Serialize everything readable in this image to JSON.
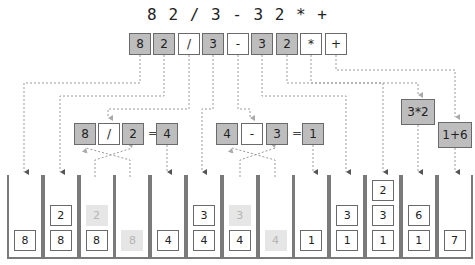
{
  "title": "8 2 / 3 - 3 2 * +",
  "tokens": [
    {
      "label": "8",
      "kind": "num",
      "x": 129
    },
    {
      "label": "2",
      "kind": "num",
      "x": 153
    },
    {
      "label": "/",
      "kind": "op",
      "x": 178
    },
    {
      "label": "3",
      "kind": "num",
      "x": 202
    },
    {
      "label": "-",
      "kind": "op",
      "x": 227
    },
    {
      "label": "3",
      "kind": "num",
      "x": 251
    },
    {
      "label": "2",
      "kind": "num",
      "x": 276
    },
    {
      "label": "*",
      "kind": "op",
      "x": 300
    },
    {
      "label": "+",
      "kind": "op",
      "x": 325
    }
  ],
  "operations": {
    "div": {
      "left": "8",
      "op": "/",
      "right": "2",
      "eq": "=",
      "result": "4"
    },
    "sub": {
      "left": "4",
      "op": "-",
      "right": "3",
      "eq": "=",
      "result": "1"
    },
    "mul": {
      "expr": "3*2"
    },
    "add": {
      "expr": "1+6"
    }
  },
  "stacks": [
    {
      "cells": [
        {
          "v": "8",
          "ghost": false
        }
      ]
    },
    {
      "cells": [
        {
          "v": "8",
          "ghost": false
        },
        {
          "v": "2",
          "ghost": false
        }
      ]
    },
    {
      "cells": [
        {
          "v": "8",
          "ghost": false
        },
        {
          "v": "2",
          "ghost": true
        }
      ]
    },
    {
      "cells": [
        {
          "v": "8",
          "ghost": true
        }
      ]
    },
    {
      "cells": [
        {
          "v": "4",
          "ghost": false
        }
      ]
    },
    {
      "cells": [
        {
          "v": "4",
          "ghost": false
        },
        {
          "v": "3",
          "ghost": false
        }
      ]
    },
    {
      "cells": [
        {
          "v": "4",
          "ghost": false
        },
        {
          "v": "3",
          "ghost": true
        }
      ]
    },
    {
      "cells": [
        {
          "v": "4",
          "ghost": true
        }
      ]
    },
    {
      "cells": [
        {
          "v": "1",
          "ghost": false
        }
      ]
    },
    {
      "cells": [
        {
          "v": "1",
          "ghost": false
        },
        {
          "v": "3",
          "ghost": false
        }
      ]
    },
    {
      "cells": [
        {
          "v": "1",
          "ghost": false
        },
        {
          "v": "3",
          "ghost": false
        },
        {
          "v": "2",
          "ghost": false
        }
      ]
    },
    {
      "cells": [
        {
          "v": "1",
          "ghost": false
        },
        {
          "v": "6",
          "ghost": false
        }
      ]
    },
    {
      "cells": [
        {
          "v": "7",
          "ghost": false
        }
      ]
    }
  ],
  "colors": {
    "operand_fill": "#bdbdbd",
    "operator_fill": "#ffffff",
    "ghost_fill": "#e6e6e6",
    "line": "#9a9a9a"
  }
}
